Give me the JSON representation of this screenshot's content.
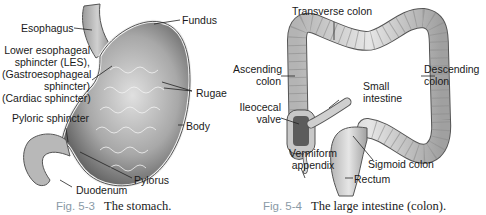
{
  "figures": [
    {
      "number": "Fig. 5-3",
      "title": "The stomach.",
      "labels": {
        "esophagus": "Esophagus",
        "fundus": "Fundus",
        "les_line1": "Lower esophageal",
        "les_line2": "sphincter (LES),",
        "les_line3": "(Gastroesophageal",
        "les_line4": "sphincter)",
        "les_line5": "(Cardiac sphincter)",
        "rugae": "Rugae",
        "pyloric_sphincter": "Pyloric sphincter",
        "body": "Body",
        "pylorus": "Pylorus",
        "duodenum": "Duodenum"
      }
    },
    {
      "number": "Fig. 5-4",
      "title": "The large intestine (colon).",
      "labels": {
        "transverse_colon": "Transverse colon",
        "ascending_line1": "Ascending",
        "ascending_line2": "colon",
        "descending_line1": "Descending",
        "descending_line2": "colon",
        "small_line1": "Small",
        "small_line2": "intestine",
        "ileocecal_line1": "Ileocecal",
        "ileocecal_line2": "valve",
        "vermiform_line1": "Vermiform",
        "vermiform_line2": "appendix",
        "sigmoid_colon": "Sigmoid colon",
        "rectum": "Rectum"
      }
    }
  ],
  "colors": {
    "caption_number": "#8a9aa6",
    "organ_outline": "#555555",
    "organ_fill_dark": "#8c8c8c",
    "organ_fill_light": "#d8d8d8"
  }
}
